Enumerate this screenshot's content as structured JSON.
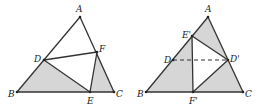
{
  "figures": [
    {
      "id": "left",
      "points": {
        "A": {
          "label": "A",
          "x": 80,
          "y": 17,
          "lx": 76,
          "ly": 12
        },
        "B": {
          "label": "B",
          "x": 17,
          "y": 92,
          "lx": 8,
          "ly": 97
        },
        "C": {
          "label": "C",
          "x": 114,
          "y": 92,
          "lx": 116,
          "ly": 97
        },
        "D": {
          "label": "D",
          "x": 44,
          "y": 60,
          "lx": 34,
          "ly": 62
        },
        "E": {
          "label": "E",
          "x": 90,
          "y": 92,
          "lx": 87,
          "ly": 104
        },
        "F": {
          "label": "F",
          "x": 97,
          "y": 52,
          "lx": 99,
          "ly": 52
        }
      },
      "shaded": [
        [
          "B",
          "D",
          "E"
        ],
        [
          "E",
          "F",
          "C"
        ]
      ],
      "edges": [
        [
          "A",
          "B"
        ],
        [
          "B",
          "C"
        ],
        [
          "C",
          "A"
        ],
        [
          "D",
          "F"
        ],
        [
          "D",
          "E"
        ],
        [
          "E",
          "F"
        ]
      ],
      "dashed": []
    },
    {
      "id": "right",
      "points": {
        "A": {
          "label": "A",
          "x": 208,
          "y": 17,
          "lx": 205,
          "ly": 12
        },
        "B": {
          "label": "B",
          "x": 146,
          "y": 92,
          "lx": 137,
          "ly": 97
        },
        "C": {
          "label": "C",
          "x": 243,
          "y": 92,
          "lx": 245,
          "ly": 97
        },
        "D": {
          "label": "D",
          "x": 173,
          "y": 60,
          "lx": 164,
          "ly": 63
        },
        "E'": {
          "label": "E'",
          "x": 192,
          "y": 36,
          "lx": 182,
          "ly": 38
        },
        "D'": {
          "label": "D'",
          "x": 228,
          "y": 60,
          "lx": 230,
          "ly": 62
        },
        "F'": {
          "label": "F'",
          "x": 193,
          "y": 92,
          "lx": 189,
          "ly": 104
        }
      },
      "shaded": [
        [
          "B",
          "E'",
          "F'"
        ],
        [
          "E'",
          "A",
          "D'"
        ],
        [
          "F'",
          "D'",
          "C"
        ]
      ],
      "edges": [
        [
          "A",
          "B"
        ],
        [
          "B",
          "C"
        ],
        [
          "C",
          "A"
        ],
        [
          "E'",
          "D'"
        ],
        [
          "E'",
          "F'"
        ],
        [
          "F'",
          "D'"
        ]
      ],
      "dashed": [
        [
          "D",
          "D'"
        ]
      ]
    }
  ],
  "colors": {
    "shade": "#d6d6d6",
    "stroke": "#333333",
    "label": "#222222"
  }
}
